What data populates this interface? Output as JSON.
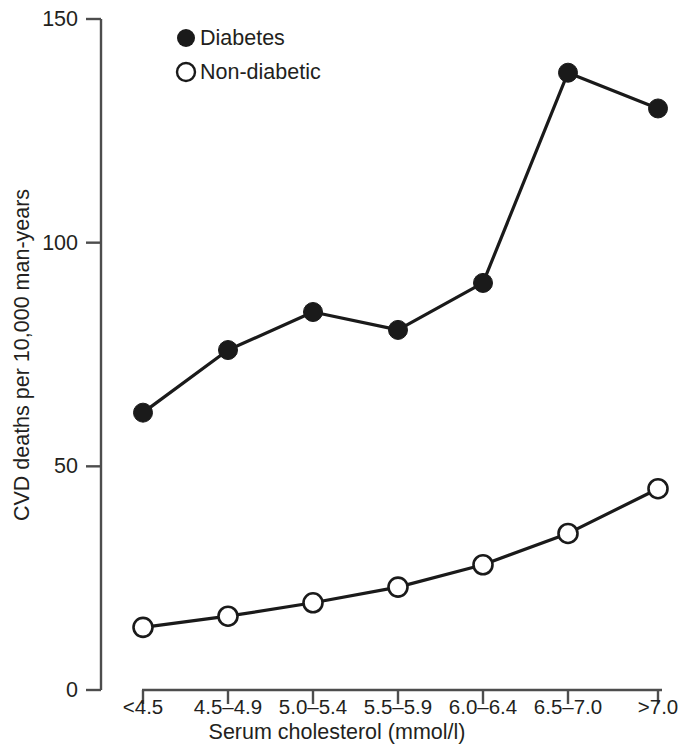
{
  "chart_data": {
    "type": "line",
    "title": "",
    "xlabel": "Serum cholesterol (mmol/l)",
    "ylabel": "CVD deaths per 10,000 man-years",
    "categories": [
      "<4.5",
      "4.5–4.9",
      "5.0–5.4",
      "5.5–5.9",
      "6.0–6.4",
      "6.5–7.0",
      ">7.0"
    ],
    "series": [
      {
        "name": "Diabetes",
        "marker": "filled-circle",
        "color": "#1a1a1a",
        "values": [
          62,
          76,
          84.5,
          80.5,
          91,
          138,
          130
        ]
      },
      {
        "name": "Non-diabetic",
        "marker": "open-circle",
        "color": "#1a1a1a",
        "values": [
          14,
          16.5,
          19.5,
          23,
          28,
          35,
          45
        ]
      }
    ],
    "ylim": [
      0,
      150
    ],
    "yticks": [
      0,
      50,
      100,
      150
    ],
    "ytick_labels": [
      "0",
      "50",
      "100",
      "150"
    ],
    "grid": false,
    "legend_position": "top-center-left"
  },
  "axes": {
    "y_tick_labels": [
      "150",
      "100",
      "50",
      "0"
    ],
    "x_tick_labels": [
      "<4.5",
      "4.5–4.9",
      "5.0–5.4",
      "5.5–5.9",
      "6.0–6.4",
      "6.5–7.0",
      ">7.0"
    ],
    "x_axis_title": "Serum cholesterol (mmol/l)",
    "y_axis_title": "CVD deaths per 10,000 man-years"
  },
  "legend": {
    "entries": [
      {
        "label": "Diabetes",
        "marker": "filled-circle"
      },
      {
        "label": "Non-diabetic",
        "marker": "open-circle"
      }
    ]
  },
  "colors": {
    "ink": "#231f20",
    "line": "#1a1a1a",
    "axis": "#4d4d4d",
    "background": "#ffffff"
  }
}
